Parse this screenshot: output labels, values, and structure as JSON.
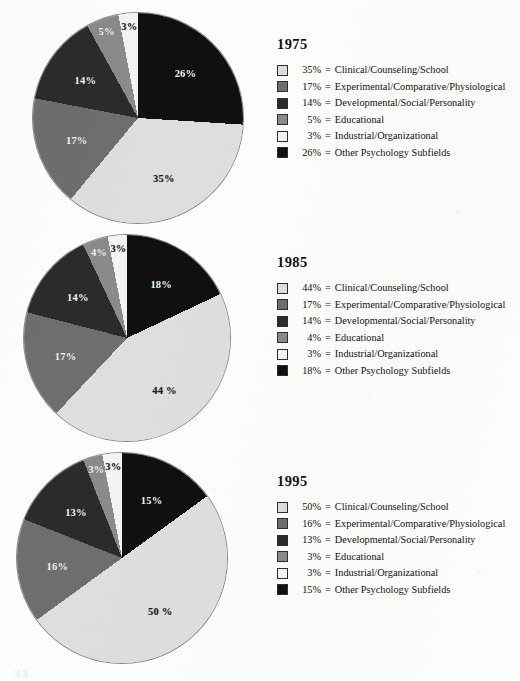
{
  "palette": {
    "clinical": "#dedede",
    "experimental": "#6e6e6e",
    "developmental": "#2b2b2b",
    "educational": "#8a8a8a",
    "industrial": "#f3f3f1",
    "other": "#101010",
    "outline": "#2e2e2e",
    "page_background": "#fdfdfb"
  },
  "page_artifact": "33",
  "chart_data": [
    {
      "type": "pie",
      "title": "1975",
      "categories": [
        "Clinical/Counseling/School",
        "Experimental/Comparative/Physiological",
        "Developmental/Social/Personality",
        "Educational",
        "Industrial/Organizational",
        "Other Psychology Subfields"
      ],
      "values": [
        35,
        17,
        14,
        5,
        3,
        26
      ],
      "slice_labels": [
        "35%",
        "17%",
        "14%",
        "5%",
        "3%",
        "26%"
      ],
      "legend_percents": [
        "35%",
        "17%",
        "14%",
        "5%",
        "3%",
        "26%"
      ],
      "legend_separator": "=",
      "colors": [
        "#dedede",
        "#6e6e6e",
        "#2b2b2b",
        "#8a8a8a",
        "#f3f3f1",
        "#101010"
      ],
      "start_angle_deg": 0,
      "draw_order": [
        "Other Psychology Subfields",
        "Clinical/Counseling/School",
        "Experimental/Comparative/Physiological",
        "Developmental/Social/Personality",
        "Educational",
        "Industrial/Organizational"
      ]
    },
    {
      "type": "pie",
      "title": "1985",
      "categories": [
        "Clinical/Counseling/School",
        "Experimental/Comparative/Physiological",
        "Developmental/Social/Personality",
        "Educational",
        "Industrial/Organizational",
        "Other Psychology Subfields"
      ],
      "values": [
        44,
        17,
        14,
        4,
        3,
        18
      ],
      "slice_labels": [
        "44 %",
        "17%",
        "14%",
        "4%",
        "3%",
        "18%"
      ],
      "legend_percents": [
        "44%",
        "17%",
        "14%",
        "4%",
        "3%",
        "18%"
      ],
      "legend_separator": "=",
      "colors": [
        "#dedede",
        "#6e6e6e",
        "#2b2b2b",
        "#8a8a8a",
        "#f3f3f1",
        "#101010"
      ],
      "start_angle_deg": 0,
      "draw_order": [
        "Other Psychology Subfields",
        "Clinical/Counseling/School",
        "Experimental/Comparative/Physiological",
        "Developmental/Social/Personality",
        "Educational",
        "Industrial/Organizational"
      ]
    },
    {
      "type": "pie",
      "title": "1995",
      "categories": [
        "Clinical/Counseling/School",
        "Experimental/Comparative/Physiological",
        "Developmental/Social/Personality",
        "Educational",
        "Industrial/Organizational",
        "Other Psychology Subfields"
      ],
      "values": [
        50,
        16,
        13,
        3,
        3,
        15
      ],
      "slice_labels": [
        "50 %",
        "16%",
        "13%",
        "3%",
        "3%",
        "15%"
      ],
      "legend_percents": [
        "50%",
        "16%",
        "13%",
        "3%",
        "3%",
        "15%"
      ],
      "legend_separator": "=",
      "colors": [
        "#dedede",
        "#6e6e6e",
        "#2b2b2b",
        "#8a8a8a",
        "#f3f3f1",
        "#101010"
      ],
      "start_angle_deg": 0,
      "draw_order": [
        "Other Psychology Subfields",
        "Clinical/Counseling/School",
        "Experimental/Comparative/Physiological",
        "Developmental/Social/Personality",
        "Educational",
        "Industrial/Organizational"
      ]
    }
  ]
}
